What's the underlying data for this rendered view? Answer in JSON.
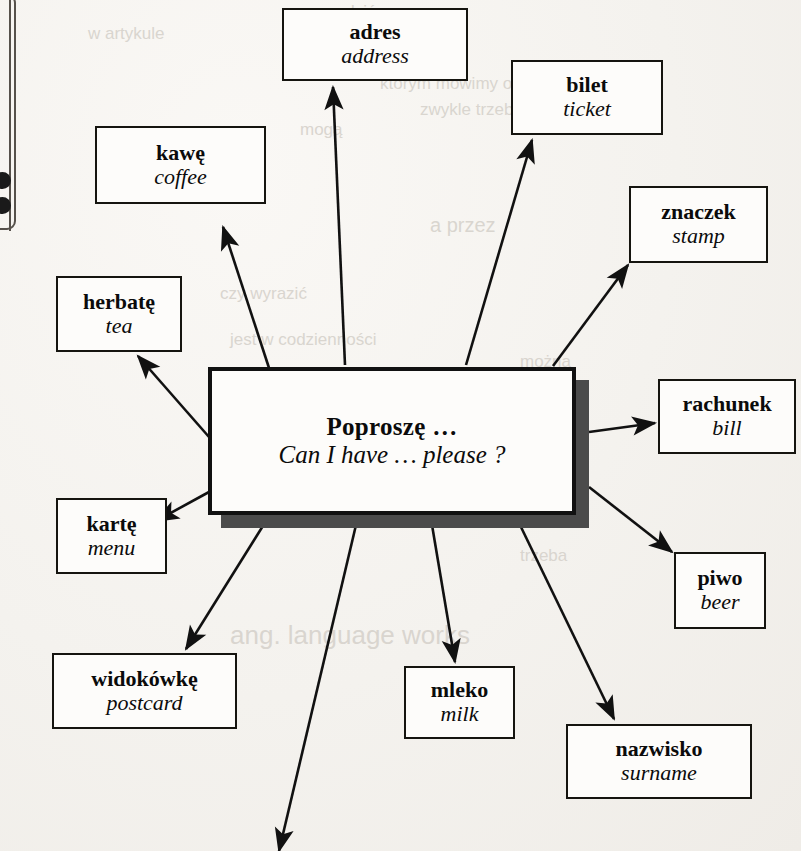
{
  "page": {
    "background_color": "#f5f3f0",
    "ink_color": "#111111",
    "shadow_color": "#4b4b4b",
    "margin_rule": "left-page-margin-rule",
    "folio_marks": "two-dark-dots"
  },
  "center": {
    "polish": "Poproszę …",
    "english": "Can I have … please ?",
    "box": {
      "x": 208,
      "y": 367,
      "w": 368,
      "h": 148
    },
    "shadow_offset": 13
  },
  "branches": [
    {
      "id": "kawe",
      "polish": "kawę",
      "english": "coffee",
      "box": {
        "x": 95,
        "y": 126,
        "w": 171,
        "h": 78
      },
      "arrow": {
        "x1": 270,
        "y1": 371,
        "x2": 223,
        "y2": 227
      }
    },
    {
      "id": "adres",
      "polish": "adres",
      "english": "address",
      "box": {
        "x": 282,
        "y": 8,
        "w": 186,
        "h": 73
      },
      "arrow": {
        "x1": 345,
        "y1": 365,
        "x2": 333,
        "y2": 87
      }
    },
    {
      "id": "bilet",
      "polish": "bilet",
      "english": "ticket",
      "box": {
        "x": 511,
        "y": 60,
        "w": 152,
        "h": 75
      },
      "arrow": {
        "x1": 466,
        "y1": 365,
        "x2": 532,
        "y2": 140
      }
    },
    {
      "id": "znaczek",
      "polish": "znaczek",
      "english": "stamp",
      "box": {
        "x": 629,
        "y": 186,
        "w": 139,
        "h": 77
      },
      "arrow": {
        "x1": 553,
        "y1": 366,
        "x2": 628,
        "y2": 265
      }
    },
    {
      "id": "herbate",
      "polish": "herbatę",
      "english": "tea",
      "box": {
        "x": 56,
        "y": 276,
        "w": 126,
        "h": 76
      },
      "arrow": {
        "x1": 209,
        "y1": 437,
        "x2": 138,
        "y2": 356
      }
    },
    {
      "id": "rachunek",
      "polish": "rachunek",
      "english": "bill",
      "box": {
        "x": 658,
        "y": 379,
        "w": 138,
        "h": 75
      },
      "arrow": {
        "x1": 589,
        "y1": 432,
        "x2": 655,
        "y2": 423
      }
    },
    {
      "id": "karte",
      "polish": "kartę",
      "english": "menu",
      "box": {
        "x": 56,
        "y": 498,
        "w": 111,
        "h": 76
      },
      "arrow": {
        "x1": 209,
        "y1": 492,
        "x2": 156,
        "y2": 521
      }
    },
    {
      "id": "piwo",
      "polish": "piwo",
      "english": "beer",
      "box": {
        "x": 674,
        "y": 552,
        "w": 92,
        "h": 77
      },
      "arrow": {
        "x1": 589,
        "y1": 487,
        "x2": 672,
        "y2": 552
      }
    },
    {
      "id": "widokowke",
      "polish": "widokówkę",
      "english": "postcard",
      "box": {
        "x": 52,
        "y": 653,
        "w": 185,
        "h": 76
      },
      "arrow": {
        "x1": 266,
        "y1": 521,
        "x2": 186,
        "y2": 649
      }
    },
    {
      "id": "mleko",
      "polish": "mleko",
      "english": "milk",
      "box": {
        "x": 404,
        "y": 666,
        "w": 111,
        "h": 73
      },
      "arrow": {
        "x1": 432,
        "y1": 525,
        "x2": 455,
        "y2": 662
      }
    },
    {
      "id": "nazwisko",
      "polish": "nazwisko",
      "english": "surname",
      "box": {
        "x": 566,
        "y": 724,
        "w": 186,
        "h": 75
      },
      "arrow": {
        "x1": 520,
        "y1": 525,
        "x2": 614,
        "y2": 719
      }
    },
    {
      "id": "unlabeled-bottom",
      "polish": "",
      "english": "",
      "box": null,
      "arrow": {
        "x1": 356,
        "y1": 525,
        "x2": 279,
        "y2": 851
      }
    }
  ],
  "bleed_through": [
    {
      "text": "sprawdzić",
      "x": 300,
      "y": 2,
      "size": 17
    },
    {
      "text": "w artykule",
      "x": 88,
      "y": 24,
      "size": 17
    },
    {
      "text": "którym mówimy o sprawach",
      "x": 380,
      "y": 74,
      "size": 17
    },
    {
      "text": "zwykle trzeba",
      "x": 420,
      "y": 100,
      "size": 17
    },
    {
      "text": "mogą",
      "x": 300,
      "y": 120,
      "size": 17
    },
    {
      "text": "a przez",
      "x": 430,
      "y": 214,
      "size": 20
    },
    {
      "text": "czy wyrazić",
      "x": 220,
      "y": 284,
      "size": 17
    },
    {
      "text": "proszę",
      "x": 120,
      "y": 306,
      "size": 17
    },
    {
      "text": "jest w codzienności",
      "x": 230,
      "y": 330,
      "size": 17
    },
    {
      "text": "można",
      "x": 520,
      "y": 352,
      "size": 17
    },
    {
      "text": "formie zwrotu",
      "x": 250,
      "y": 404,
      "size": 20
    },
    {
      "text": "ludzie i tak",
      "x": 240,
      "y": 474,
      "size": 20
    },
    {
      "text": "to kwestia",
      "x": 430,
      "y": 498,
      "size": 17
    },
    {
      "text": "trzeba",
      "x": 520,
      "y": 546,
      "size": 17
    },
    {
      "text": "ang. language works",
      "x": 230,
      "y": 620,
      "size": 26
    }
  ]
}
